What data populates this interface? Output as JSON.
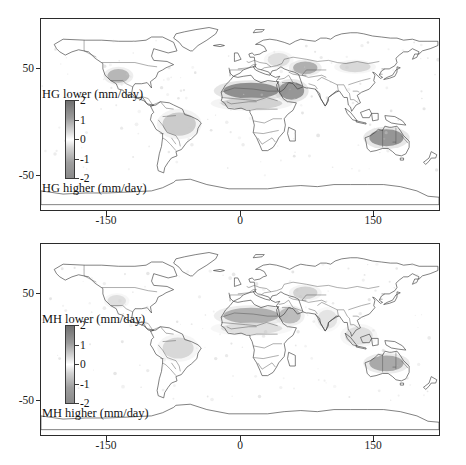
{
  "figure": {
    "type": "two-panel-world-map",
    "background": "#ffffff",
    "panels": [
      {
        "id": "top",
        "colorbar": {
          "title_top": "HG lower (mm/day)",
          "title_bottom": "HG higher (mm/day)",
          "ticks": [
            "2",
            "1",
            "0",
            "-1",
            "-2"
          ],
          "vmin": -2,
          "vmax": 2,
          "units": "mm/day",
          "color_high": "#6f6f6f",
          "color_mid": "#ffffff",
          "color_low": "#8a8a8a"
        },
        "xaxis": {
          "ticks": [
            "-150",
            "0",
            "150"
          ],
          "values": [
            -150,
            0,
            150
          ],
          "range": [
            -180,
            180
          ]
        },
        "yaxis": {
          "ticks": [
            "50",
            "-50"
          ],
          "values": [
            50,
            -50
          ],
          "range": [
            -90,
            90
          ]
        }
      },
      {
        "id": "bottom",
        "colorbar": {
          "title_top": "MH lower (mm/day)",
          "title_bottom": "MH higher (mm/day)",
          "ticks": [
            "2",
            "1",
            "0",
            "-1",
            "-2"
          ],
          "vmin": -2,
          "vmax": 2,
          "units": "mm/day",
          "color_high": "#6f6f6f",
          "color_mid": "#ffffff",
          "color_low": "#8a8a8a"
        },
        "xaxis": {
          "ticks": [
            "-150",
            "0",
            "150"
          ],
          "values": [
            -150,
            0,
            150
          ],
          "range": [
            -180,
            180
          ]
        },
        "yaxis": {
          "ticks": [
            "50",
            "-50"
          ],
          "values": [
            50,
            -50
          ],
          "range": [
            -90,
            90
          ]
        }
      }
    ]
  },
  "chart_data": {
    "type": "heatmap",
    "title": "",
    "xlabel": "",
    "ylabel": "",
    "xlim": [
      -180,
      180
    ],
    "ylim": [
      -90,
      90
    ],
    "grid": false,
    "legend": "inset vertical colorbar, left of each map",
    "colormap": "grey diverging (dark = large magnitude, white = near zero)",
    "panels": [
      {
        "name": "HG",
        "colorbar_label_top": "HG lower (mm/day)",
        "colorbar_label_bottom": "HG higher (mm/day)",
        "cbar_ticks": [
          2,
          1,
          0,
          -1,
          -2
        ],
        "regions": [
          {
            "name": "Sahara / North Africa",
            "lon": [
              -15,
              35
            ],
            "lat": [
              15,
              30
            ],
            "value": 1.7
          },
          {
            "name": "Sahel",
            "lon": [
              -17,
              38
            ],
            "lat": [
              5,
              16
            ],
            "value": 0.7
          },
          {
            "name": "Arabian Peninsula",
            "lon": [
              35,
              58
            ],
            "lat": [
              14,
              31
            ],
            "value": 1.6
          },
          {
            "name": "Central Asia / Caspian",
            "lon": [
              48,
              70
            ],
            "lat": [
              38,
              50
            ],
            "value": 1.2
          },
          {
            "name": "Southwest United States",
            "lon": [
              -120,
              -100
            ],
            "lat": [
              30,
              43
            ],
            "value": 1.1
          },
          {
            "name": "Amazon / Brazil",
            "lon": [
              -70,
              -40
            ],
            "lat": [
              -20,
              2
            ],
            "value": 0.8
          },
          {
            "name": "Central Australia",
            "lon": [
              117,
              148
            ],
            "lat": [
              -30,
              -14
            ],
            "value": 1.6
          },
          {
            "name": "Mongolia / Gobi",
            "lon": [
              90,
              118
            ],
            "lat": [
              40,
              50
            ],
            "value": 0.6
          },
          {
            "name": "Eastern Europe",
            "lon": [
              25,
              45
            ],
            "lat": [
              45,
              58
            ],
            "value": 0.5
          }
        ]
      },
      {
        "name": "MH",
        "colorbar_label_top": "MH lower (mm/day)",
        "colorbar_label_bottom": "MH higher (mm/day)",
        "cbar_ticks": [
          2,
          1,
          0,
          -1,
          -2
        ],
        "regions": [
          {
            "name": "Sahara / North Africa",
            "lon": [
              -15,
              35
            ],
            "lat": [
              15,
              30
            ],
            "value": 1.2
          },
          {
            "name": "Sahel",
            "lon": [
              -17,
              38
            ],
            "lat": [
              5,
              16
            ],
            "value": 0.5
          },
          {
            "name": "Arabian Peninsula",
            "lon": [
              35,
              55
            ],
            "lat": [
              15,
              30
            ],
            "value": 1.0
          },
          {
            "name": "Central Asia / Caspian",
            "lon": [
              48,
              70
            ],
            "lat": [
              38,
              50
            ],
            "value": 0.7
          },
          {
            "name": "Southwest United States",
            "lon": [
              -120,
              -103
            ],
            "lat": [
              31,
              42
            ],
            "value": 0.5
          },
          {
            "name": "Amazon / Brazil",
            "lon": [
              -70,
              -42
            ],
            "lat": [
              -18,
              2
            ],
            "value": 0.6
          },
          {
            "name": "Central Australia",
            "lon": [
              117,
              148
            ],
            "lat": [
              -30,
              -15
            ],
            "value": 1.3
          },
          {
            "name": "Southeast Asia",
            "lon": [
              95,
              120
            ],
            "lat": [
              -5,
              12
            ],
            "value": 0.5
          },
          {
            "name": "India",
            "lon": [
              70,
              88
            ],
            "lat": [
              10,
              28
            ],
            "value": 0.4
          }
        ]
      }
    ]
  }
}
